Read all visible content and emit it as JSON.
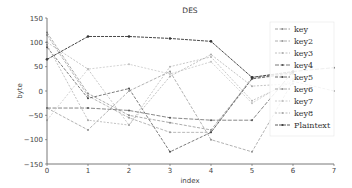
{
  "chart_data": {
    "type": "line",
    "title": "DES",
    "xlabel": "index",
    "ylabel": "byte",
    "xlim": [
      0,
      7
    ],
    "ylim": [
      -150,
      150
    ],
    "xticks": [
      "0",
      "1",
      "2",
      "3",
      "4",
      "5",
      "6",
      "7"
    ],
    "yticks": [
      "150",
      "100",
      "50",
      "0",
      "−50",
      "−100",
      "−150"
    ],
    "grid": false,
    "legend_position": "upper right",
    "x": [
      0,
      1,
      2,
      3,
      4,
      5,
      6,
      7
    ],
    "series": [
      {
        "name": "key",
        "color": "#888888",
        "values": [
          120,
          -5,
          -50,
          -65,
          -80,
          25,
          35,
          null
        ]
      },
      {
        "name": "key2",
        "color": "#999999",
        "values": [
          115,
          -10,
          -55,
          -85,
          -85,
          28,
          38,
          null
        ]
      },
      {
        "name": "key3",
        "color": "#b0b0b0",
        "values": [
          100,
          45,
          -70,
          50,
          70,
          -20,
          20,
          null
        ]
      },
      {
        "name": "key4",
        "color": "#555555",
        "values": [
          -35,
          -35,
          -40,
          -55,
          -60,
          -60,
          40,
          48
        ]
      },
      {
        "name": "key5",
        "color": "#444444",
        "values": [
          90,
          -15,
          5,
          -125,
          -85,
          25,
          38,
          null
        ]
      },
      {
        "name": "key6",
        "color": "#909090",
        "values": [
          -35,
          -80,
          0,
          40,
          -100,
          -125,
          20,
          0
        ]
      },
      {
        "name": "key7",
        "color": "#c0c0c0",
        "values": [
          -60,
          45,
          55,
          35,
          60,
          -25,
          25,
          null
        ]
      },
      {
        "name": "key8",
        "color": "#a8a8a8",
        "values": [
          95,
          -60,
          -70,
          30,
          75,
          10,
          15,
          null
        ]
      },
      {
        "name": "Plaintext",
        "color": "#333333",
        "values": [
          65,
          112,
          112,
          108,
          102,
          28,
          40,
          null
        ]
      }
    ]
  },
  "legend": {
    "items": [
      "key",
      "key2",
      "key3",
      "key4",
      "key5",
      "key6",
      "key7",
      "key8",
      "Plaintext"
    ]
  }
}
